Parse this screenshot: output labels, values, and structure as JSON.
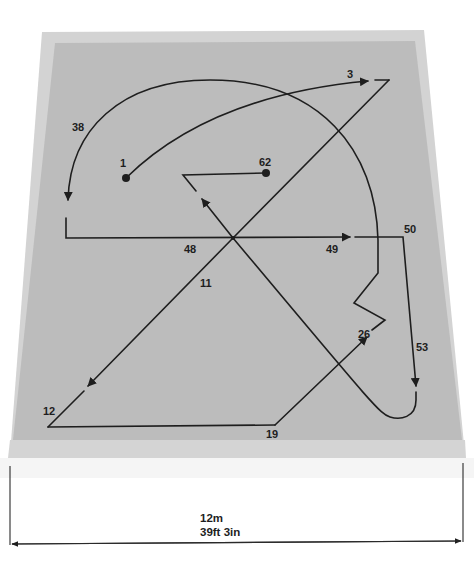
{
  "diagram": {
    "type": "floor-pattern-route",
    "colors": {
      "background": "#ffffff",
      "mat_border": "#d2d2d2",
      "mat_inner": "#bdbdbd",
      "mat_front_edge": "#d6d6d6",
      "line": "#1e1e1e"
    },
    "points": [
      {
        "label": "1",
        "x": 126,
        "y": 178,
        "marker": "dot"
      },
      {
        "label": "3",
        "x": 389,
        "y": 80
      },
      {
        "label": "11",
        "x": 233,
        "y": 238
      },
      {
        "label": "12",
        "x": 48,
        "y": 427
      },
      {
        "label": "19",
        "x": 275,
        "y": 425
      },
      {
        "label": "26",
        "x": 385,
        "y": 320
      },
      {
        "label": "38",
        "x": 68,
        "y": 210
      },
      {
        "label": "48",
        "x": 233,
        "y": 238
      },
      {
        "label": "49",
        "x": 350,
        "y": 237
      },
      {
        "label": "50",
        "x": 403,
        "y": 237
      },
      {
        "label": "53",
        "x": 416,
        "y": 385
      },
      {
        "label": "62",
        "x": 266,
        "y": 173,
        "marker": "dot"
      }
    ],
    "labels": {
      "p1": "1",
      "p3": "3",
      "p11": "11",
      "p12": "12",
      "p19": "19",
      "p26": "26",
      "p38": "38",
      "p48": "48",
      "p49": "49",
      "p50": "50",
      "p53": "53",
      "p62": "62"
    },
    "dimension": {
      "metric": "12m",
      "imperial": "39ft 3in"
    }
  }
}
